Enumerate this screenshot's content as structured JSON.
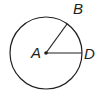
{
  "diagram": {
    "type": "circle-with-radii",
    "stroke_color": "#231f20",
    "background": "#ffffff",
    "circle": {
      "center_label": "A",
      "cx": 46,
      "cy": 53,
      "r": 36
    },
    "points": [
      {
        "label": "A",
        "role": "center"
      },
      {
        "label": "B",
        "role": "point-on-circle"
      },
      {
        "label": "D",
        "role": "point-on-circle"
      }
    ],
    "segments": [
      {
        "from": "A",
        "to": "B"
      },
      {
        "from": "A",
        "to": "D"
      }
    ],
    "labels": {
      "a": "A",
      "b": "B",
      "d": "D"
    }
  }
}
